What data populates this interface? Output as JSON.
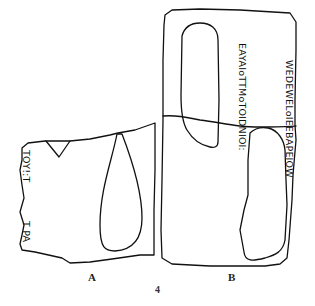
{
  "figure": {
    "number": "4",
    "fragments": [
      {
        "label": "A",
        "inscriptions": [
          {
            "text": "TOY!:T",
            "orientation": "rotated-90-cw"
          },
          {
            "text": "T PA",
            "orientation": "rotated-90-cw"
          }
        ]
      },
      {
        "label": "B",
        "inscriptions": [
          {
            "text": "EAYAIoTTMoTOIDNIOI:",
            "orientation": "rotated-90-cw"
          },
          {
            "text": "WEDEWELoIEEBAPEIOW",
            "orientation": "rotated-90-cw"
          }
        ]
      }
    ],
    "stroke_color": "#111111",
    "background_color": "#ffffff"
  }
}
